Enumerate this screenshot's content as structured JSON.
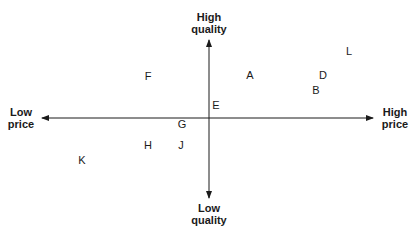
{
  "axes": {
    "top": {
      "line1": "High",
      "line2": "quality"
    },
    "bottom": {
      "line1": "Low",
      "line2": "quality"
    },
    "left": {
      "line1": "Low",
      "line2": "price"
    },
    "right": {
      "line1": "High",
      "line2": "price"
    }
  },
  "points": [
    {
      "label": "L",
      "x": 349,
      "y": 51
    },
    {
      "label": "F",
      "x": 148,
      "y": 76
    },
    {
      "label": "A",
      "x": 250,
      "y": 75
    },
    {
      "label": "D",
      "x": 323,
      "y": 75
    },
    {
      "label": "B",
      "x": 316,
      "y": 90
    },
    {
      "label": "E",
      "x": 216,
      "y": 105
    },
    {
      "label": "G",
      "x": 182,
      "y": 124
    },
    {
      "label": "H",
      "x": 148,
      "y": 145
    },
    {
      "label": "J",
      "x": 181,
      "y": 145
    },
    {
      "label": "K",
      "x": 82,
      "y": 160
    }
  ]
}
